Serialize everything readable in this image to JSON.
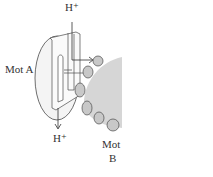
{
  "diagram": {
    "labels": {
      "h_top": "H⁺",
      "h_bottom": "H⁺",
      "mot_a": "Mot A",
      "mot_b_line1": "Mot",
      "mot_b_line2": "B"
    },
    "colors": {
      "stroke": "#4a4a4a",
      "fill_light": "#f2f2f2",
      "rotor_gray": "#d6d6d6",
      "bead": "#c8c8c8"
    }
  }
}
